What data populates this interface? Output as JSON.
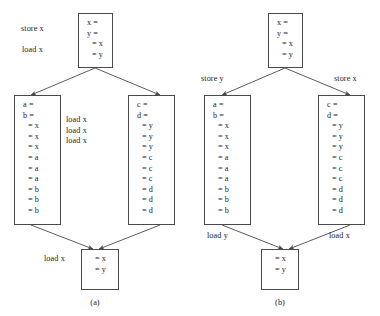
{
  "figure": {
    "caption_a": "(a)",
    "caption_b": "(b)",
    "diagrams": [
      {
        "id": "a",
        "caption": "(a)",
        "entry_block": {
          "name": "entry-block",
          "ops": [
            {
              "text": "x =",
              "kind": "def"
            },
            {
              "text": "y =",
              "kind": "def"
            },
            {
              "text": "= x",
              "kind": "use"
            },
            {
              "text": "= y",
              "kind": "use"
            }
          ]
        },
        "left_block": {
          "name": "left-block",
          "ops": [
            {
              "text": "a =",
              "kind": "def"
            },
            {
              "text": "b =",
              "kind": "def"
            },
            {
              "text": "= x",
              "kind": "use"
            },
            {
              "text": "= x",
              "kind": "use"
            },
            {
              "text": "= x",
              "kind": "use"
            },
            {
              "text": "= a",
              "kind": "use"
            },
            {
              "text": "= a",
              "kind": "use"
            },
            {
              "text": "= a",
              "kind": "use"
            },
            {
              "text": "= b",
              "kind": "use"
            },
            {
              "text": "= b",
              "kind": "use"
            },
            {
              "text": "= b",
              "kind": "use"
            }
          ]
        },
        "right_block": {
          "name": "right-block",
          "ops": [
            {
              "text": "c =",
              "kind": "def"
            },
            {
              "text": "d =",
              "kind": "def"
            },
            {
              "text": "= y",
              "kind": "use"
            },
            {
              "text": "= y",
              "kind": "use"
            },
            {
              "text": "= y",
              "kind": "use"
            },
            {
              "text": "= c",
              "kind": "use"
            },
            {
              "text": "= c",
              "kind": "use"
            },
            {
              "text": "= c",
              "kind": "use"
            },
            {
              "text": "= d",
              "kind": "use"
            },
            {
              "text": "= d",
              "kind": "use"
            },
            {
              "text": "= d",
              "kind": "use"
            }
          ]
        },
        "merge_block": {
          "name": "merge-block",
          "ops": [
            {
              "text": "= x",
              "kind": "use"
            },
            {
              "text": "= y",
              "kind": "use"
            }
          ]
        },
        "annotations": {
          "entry_store": "store x",
          "entry_load": "load x",
          "middle_loads": [
            "load x",
            "load x",
            "load x"
          ],
          "merge_load": "load x"
        }
      },
      {
        "id": "b",
        "caption": "(b)",
        "entry_block": {
          "name": "entry-block",
          "ops": [
            {
              "text": "x =",
              "kind": "def"
            },
            {
              "text": "y =",
              "kind": "def"
            },
            {
              "text": "= x",
              "kind": "use"
            },
            {
              "text": "= y",
              "kind": "use"
            }
          ]
        },
        "left_block": {
          "name": "left-block",
          "ops": [
            {
              "text": "a =",
              "kind": "def"
            },
            {
              "text": "b =",
              "kind": "def"
            },
            {
              "text": "= x",
              "kind": "use"
            },
            {
              "text": "= x",
              "kind": "use"
            },
            {
              "text": "= x",
              "kind": "use"
            },
            {
              "text": "= a",
              "kind": "use"
            },
            {
              "text": "= a",
              "kind": "use"
            },
            {
              "text": "= a",
              "kind": "use"
            },
            {
              "text": "= b",
              "kind": "use"
            },
            {
              "text": "= b",
              "kind": "use"
            },
            {
              "text": "= b",
              "kind": "use"
            }
          ]
        },
        "right_block": {
          "name": "right-block",
          "ops": [
            {
              "text": "c =",
              "kind": "def"
            },
            {
              "text": "d =",
              "kind": "def"
            },
            {
              "text": "= y",
              "kind": "use"
            },
            {
              "text": "= y",
              "kind": "use"
            },
            {
              "text": "= y",
              "kind": "use"
            },
            {
              "text": "= c",
              "kind": "use"
            },
            {
              "text": "= c",
              "kind": "use"
            },
            {
              "text": "= c",
              "kind": "use"
            },
            {
              "text": "= d",
              "kind": "use"
            },
            {
              "text": "= d",
              "kind": "use"
            },
            {
              "text": "= d",
              "kind": "use"
            }
          ]
        },
        "merge_block": {
          "name": "merge-block",
          "ops": [
            {
              "text": "= x",
              "kind": "use"
            },
            {
              "text": "= y",
              "kind": "use"
            }
          ]
        },
        "annotations": {
          "left_store": "store y",
          "right_store": "store x",
          "left_load": "load y",
          "right_load": "load x"
        }
      }
    ]
  },
  "style": {
    "line_color": "#4a4a4a",
    "text_color": "#1d1d1d",
    "background": "#ffffff"
  }
}
